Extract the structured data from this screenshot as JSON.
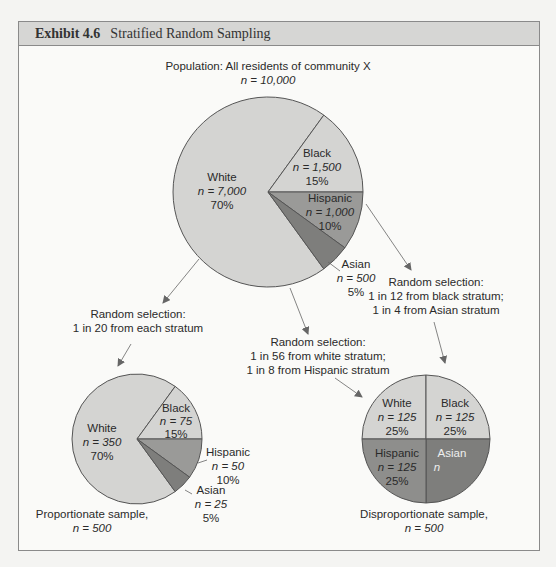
{
  "running_head": "SAMPLING IN THE SOCIAL WORLD",
  "exhibit": {
    "number": "Exhibit 4.6",
    "title": "Stratified Random Sampling"
  },
  "population": {
    "title": "Population: All residents of community X",
    "n_label": "n = 10,000",
    "slices": {
      "white": {
        "name": "White",
        "n": "n = 7,000",
        "pct": "70%"
      },
      "black": {
        "name": "Black",
        "n": "n = 1,500",
        "pct": "15%"
      },
      "hispanic": {
        "name": "Hispanic",
        "n": "n = 1,000",
        "pct": "10%"
      },
      "asian": {
        "name": "Asian",
        "n": "n = 500",
        "pct": "5%"
      }
    }
  },
  "selections": {
    "proportionate": {
      "line1": "Random selection:",
      "line2": "1 in 20 from each stratum"
    },
    "white_hispanic": {
      "line1": "Random selection:",
      "line2": "1 in 56 from white stratum;",
      "line3": "1 in 8 from Hispanic stratum"
    },
    "black_asian": {
      "line1": "Random selection:",
      "line2": "1 in 12 from black stratum;",
      "line3": "1 in 4 from Asian stratum"
    }
  },
  "proportionate_sample": {
    "caption_line1": "Proportionate sample,",
    "caption_line2": "n = 500",
    "slices": {
      "white": {
        "name": "White",
        "n": "n = 350",
        "pct": "70%"
      },
      "black": {
        "name": "Black",
        "n": "n = 75",
        "pct": "15%"
      },
      "hispanic": {
        "name": "Hispanic",
        "n": "n = 50",
        "pct": "10%"
      },
      "asian": {
        "name": "Asian",
        "n": "n = 25",
        "pct": "5%"
      }
    }
  },
  "disproportionate_sample": {
    "caption_line1": "Disproportionate sample,",
    "caption_line2": "n = 500",
    "slices": {
      "white": {
        "name": "White",
        "n": "n = 125",
        "pct": "25%"
      },
      "black": {
        "name": "Black",
        "n": "n = 125",
        "pct": "25%"
      },
      "hispanic": {
        "name": "Hispanic",
        "n": "n = 125",
        "pct": "25%"
      },
      "asian": {
        "name": "Asian",
        "n": "n",
        "pct": ""
      }
    }
  },
  "colors": {
    "light_slice": "#d4d4d2",
    "hispanic_slice": "#9a9a98",
    "asian_slice": "#7e7e7c",
    "outline": "#555555",
    "arrow": "#666666",
    "header_bg": "#d6d6d4"
  }
}
